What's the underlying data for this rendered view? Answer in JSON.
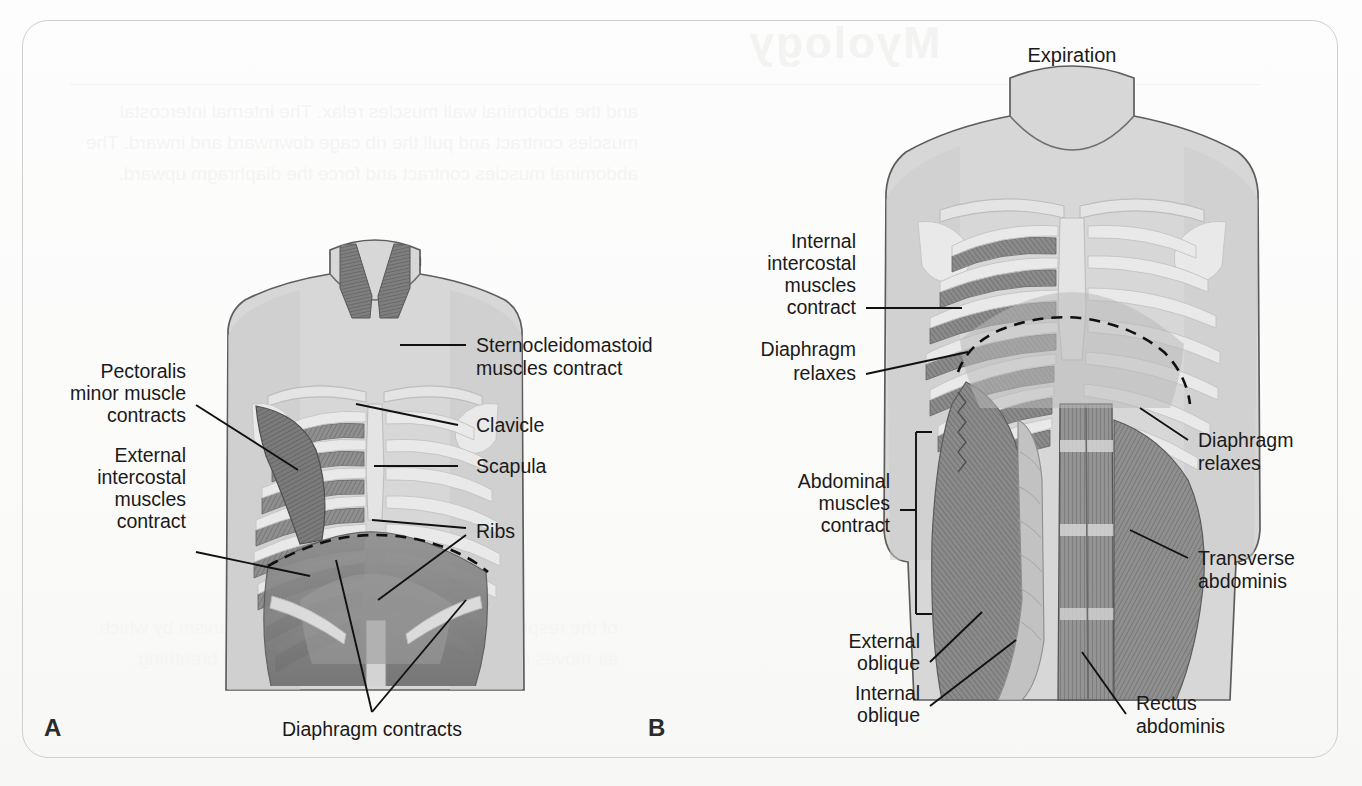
{
  "figure": {
    "panels": [
      {
        "letter": "A",
        "title": "Inspiration",
        "labels": [
          "Sternocleidomastoid\nmuscles contract",
          "Pectoralis\nminor muscle\ncontracts",
          "Clavicle",
          "Scapula",
          "External\nintercostal\nmuscles\ncontract",
          "Ribs",
          "Diaphragm contracts"
        ]
      },
      {
        "letter": "B",
        "title": "Expiration",
        "labels": [
          "Internal\nintercostal\nmuscles\ncontract",
          "Diaphragm\nrelaxes",
          "Diaphragm\nrelaxes",
          "Abdominal\nmuscles\ncontract",
          "External\noblique",
          "Internal\noblique",
          "Transverse\nabdominis",
          "Rectus\nabdominis"
        ]
      }
    ]
  },
  "panel_a": {
    "letter": "A",
    "title": "Inspiration",
    "label_sternocleidomastoid_l1": "Sternocleidomastoid",
    "label_sternocleidomastoid_l2": "muscles contract",
    "label_pectoralis_l1": "Pectoralis",
    "label_pectoralis_l2": "minor muscle",
    "label_pectoralis_l3": "contracts",
    "label_clavicle": "Clavicle",
    "label_scapula": "Scapula",
    "label_external_intercostal_l1": "External",
    "label_external_intercostal_l2": "intercostal",
    "label_external_intercostal_l3": "muscles",
    "label_external_intercostal_l4": "contract",
    "label_ribs": "Ribs",
    "label_diaphragm": "Diaphragm contracts"
  },
  "panel_b": {
    "letter": "B",
    "title": "Expiration",
    "label_internal_intercostal_l1": "Internal",
    "label_internal_intercostal_l2": "intercostal",
    "label_internal_intercostal_l3": "muscles",
    "label_internal_intercostal_l4": "contract",
    "label_diaphragm_left_l1": "Diaphragm",
    "label_diaphragm_left_l2": "relaxes",
    "label_diaphragm_right_l1": "Diaphragm",
    "label_diaphragm_right_l2": "relaxes",
    "label_abdominal_l1": "Abdominal",
    "label_abdominal_l2": "muscles",
    "label_abdominal_l3": "contract",
    "label_external_oblique_l1": "External",
    "label_external_oblique_l2": "oblique",
    "label_internal_oblique_l1": "Internal",
    "label_internal_oblique_l2": "oblique",
    "label_transverse_l1": "Transverse",
    "label_transverse_l2": "abdominis",
    "label_rectus_l1": "Rectus",
    "label_rectus_l2": "abdominis"
  },
  "ghost": {
    "heading": "Myology",
    "body": "and the abdominal wall muscles relax. The internal intercostal muscles contract and pull the rib cage downward and inward. The abdominal muscles contract and force the diaphragm upward.",
    "body2": "of the respiratory muscles is the primary mechanism by which air moves into and out of the lungs during quiet breathing."
  },
  "colors": {
    "paper": "#fbfbfa",
    "card_border": "#cfcfcf",
    "skin": "#d7d7d7",
    "bone": "#e4e4e4",
    "muscle_dark": "#8a8a8a",
    "muscle_mid": "#9e9e9e",
    "muscle_deep": "#757575",
    "label_text": "#1a1a1a",
    "leader_line": "#111111"
  }
}
